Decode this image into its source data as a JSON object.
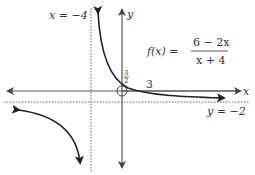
{
  "diagram": {
    "type": "function-graph",
    "function_label": {
      "lhs": "f(x) =",
      "numerator": "6 − 2x",
      "denominator": "x + 4"
    },
    "axes": {
      "x_label": "x",
      "y_label": "y"
    },
    "asymptotes": {
      "vertical_label": "x = −4",
      "horizontal_label": "y = −2"
    },
    "intercepts": {
      "y_intercept_label_num": "3",
      "y_intercept_label_den": "2",
      "x_intercept_label": "3"
    },
    "hole_marker": "open-circle-at-origin",
    "colors": {
      "curve": "#222222",
      "axis": "#555555",
      "asymptote": "#666666",
      "text": "#333333"
    }
  }
}
